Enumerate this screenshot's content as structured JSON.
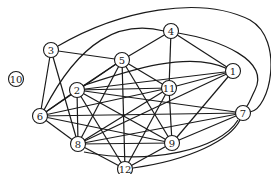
{
  "diagram": {
    "type": "graph",
    "directed": false,
    "nodes": [
      {
        "id": "1",
        "label": "1",
        "x": 233,
        "y": 71
      },
      {
        "id": "2",
        "label": "2",
        "x": 77,
        "y": 90
      },
      {
        "id": "3",
        "label": "3",
        "x": 51,
        "y": 50
      },
      {
        "id": "4",
        "label": "4",
        "x": 171,
        "y": 31
      },
      {
        "id": "5",
        "label": "5",
        "x": 122,
        "y": 60
      },
      {
        "id": "6",
        "label": "6",
        "x": 40,
        "y": 116
      },
      {
        "id": "7",
        "label": "7",
        "x": 243,
        "y": 113
      },
      {
        "id": "8",
        "label": "8",
        "x": 78,
        "y": 144
      },
      {
        "id": "9",
        "label": "9",
        "x": 172,
        "y": 143
      },
      {
        "id": "10",
        "label": "10",
        "x": 16,
        "y": 79
      },
      {
        "id": "11",
        "label": "11",
        "x": 169,
        "y": 88
      },
      {
        "id": "12",
        "label": "12",
        "x": 125,
        "y": 169
      }
    ],
    "edges": [
      [
        "3",
        "5"
      ],
      [
        "3",
        "6"
      ],
      [
        "3",
        "8"
      ],
      [
        "4",
        "5"
      ],
      [
        "4",
        "1"
      ],
      [
        "4",
        "11"
      ],
      [
        "5",
        "2"
      ],
      [
        "5",
        "11"
      ],
      [
        "5",
        "8"
      ],
      [
        "5",
        "9"
      ],
      [
        "5",
        "12"
      ],
      [
        "5",
        "6"
      ],
      [
        "1",
        "11"
      ],
      [
        "1",
        "2"
      ],
      [
        "1",
        "9"
      ],
      [
        "1",
        "8"
      ],
      [
        "2",
        "11"
      ],
      [
        "2",
        "8"
      ],
      [
        "2",
        "9"
      ],
      [
        "2",
        "12"
      ],
      [
        "2",
        "7"
      ],
      [
        "2",
        "6"
      ],
      [
        "11",
        "9"
      ],
      [
        "11",
        "8"
      ],
      [
        "11",
        "6"
      ],
      [
        "11",
        "12"
      ],
      [
        "6",
        "8"
      ],
      [
        "6",
        "7"
      ],
      [
        "6",
        "9"
      ],
      [
        "7",
        "8"
      ],
      [
        "7",
        "9"
      ],
      [
        "8",
        "9"
      ],
      [
        "8",
        "12"
      ],
      [
        "9",
        "12"
      ]
    ],
    "curved_edges": [
      {
        "from": "3",
        "to": "7",
        "path": "M 58 46 C 120 10, 200 -5, 250 20 C 285 40, 270 110, 250 112"
      },
      {
        "from": "6",
        "to": "4",
        "path": "M 44 110 C 80 40, 120 20, 164 31"
      },
      {
        "from": "4",
        "to": "7",
        "path": "M 178 33 C 220 40, 270 60, 255 90 C 250 100, 248 106, 246 107"
      },
      {
        "from": "12",
        "to": "7",
        "path": "M 133 168 C 190 160, 230 140, 240 120"
      },
      {
        "from": "2",
        "to": "1",
        "path": "M 82 86 C 130 70, 190 50, 228 69"
      },
      {
        "from": "8",
        "to": "7",
        "path": "M 84 152 C 150 165, 220 150, 238 120"
      }
    ]
  }
}
